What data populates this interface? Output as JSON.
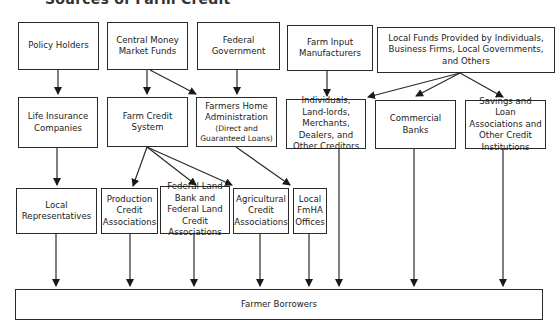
{
  "diagram": {
    "heading": "Sources of Farm Credit",
    "sources": {
      "policy_holders": "Policy Holders",
      "central_money_market": "Central Money Market Funds",
      "federal_government": "Federal Government",
      "farm_input_manufacturers": "Farm Input Manufacturers",
      "local_funds": "Local Funds Provided by Individuals, Business Firms, Local Governments, and Others"
    },
    "intermediaries": {
      "life_insurance": "Life Insurance Companies",
      "farm_credit_system": "Farm Credit System",
      "fmha_title": "Farmers Home Administration",
      "fmha_sub": "(Direct and Guaranteed Loans)",
      "individuals": "Individuals, Land-lords, Merchants, Dealers, and Other Creditors",
      "commercial_banks": "Commercial Banks",
      "savings_loan": "Savings and Loan Associations and Other Credit Institutions"
    },
    "local_units": {
      "local_representatives": "Local Representatives",
      "production_credit": "Production Credit Associations",
      "federal_land_bank": "Federal Land Bank and Federal Land Credit Associations",
      "agricultural_credit": "Agricultural Credit Associations",
      "local_fmha": "Local FmHA Offices"
    },
    "destination": "Farmer Borrowers",
    "colors": {
      "line": "#2a2a2a",
      "background": "#ffffff"
    }
  }
}
